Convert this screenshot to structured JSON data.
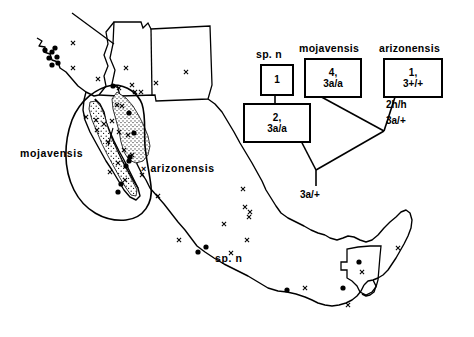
{
  "figure": {
    "type": "distribution-map-with-phylogeny",
    "background_color": "#ffffff",
    "line_color": "#000000"
  },
  "map": {
    "region_labels": [
      {
        "id": "mojavensis",
        "text": "mojavensis",
        "x": 20,
        "y": 148
      },
      {
        "id": "arizonensis",
        "text": "arizonensis",
        "x": 149,
        "y": 163,
        "marker": "x"
      },
      {
        "id": "sp-n",
        "text": "sp. n",
        "x": 215,
        "y": 253
      }
    ],
    "marker_legend": {
      "x_marker": "x",
      "dot_marker": "filled-circle",
      "stipple": "shaded-distribution-area"
    },
    "x_markers": [
      {
        "x": 73,
        "y": 43
      },
      {
        "x": 73,
        "y": 68
      },
      {
        "x": 126,
        "y": 68
      },
      {
        "x": 98,
        "y": 79
      },
      {
        "x": 156,
        "y": 83
      },
      {
        "x": 132,
        "y": 85
      },
      {
        "x": 186,
        "y": 72
      },
      {
        "x": 135,
        "y": 92
      },
      {
        "x": 141,
        "y": 92
      },
      {
        "x": 119,
        "y": 88
      },
      {
        "x": 117,
        "y": 105
      },
      {
        "x": 122,
        "y": 106
      },
      {
        "x": 86,
        "y": 117
      },
      {
        "x": 96,
        "y": 120
      },
      {
        "x": 104,
        "y": 124
      },
      {
        "x": 97,
        "y": 130
      },
      {
        "x": 112,
        "y": 121
      },
      {
        "x": 119,
        "y": 132
      },
      {
        "x": 128,
        "y": 135
      },
      {
        "x": 108,
        "y": 142
      },
      {
        "x": 124,
        "y": 150
      },
      {
        "x": 132,
        "y": 155
      },
      {
        "x": 118,
        "y": 163
      },
      {
        "x": 110,
        "y": 172
      },
      {
        "x": 125,
        "y": 180
      },
      {
        "x": 142,
        "y": 175
      },
      {
        "x": 158,
        "y": 196
      },
      {
        "x": 243,
        "y": 189
      },
      {
        "x": 245,
        "y": 207
      },
      {
        "x": 250,
        "y": 212
      },
      {
        "x": 249,
        "y": 217
      },
      {
        "x": 224,
        "y": 224
      },
      {
        "x": 247,
        "y": 240
      },
      {
        "x": 179,
        "y": 240
      },
      {
        "x": 231,
        "y": 253
      },
      {
        "x": 305,
        "y": 288
      },
      {
        "x": 348,
        "y": 305
      },
      {
        "x": 362,
        "y": 272
      },
      {
        "x": 398,
        "y": 248
      }
    ],
    "dot_markers": [
      {
        "x": 45,
        "y": 50
      },
      {
        "x": 52,
        "y": 52
      },
      {
        "x": 49,
        "y": 58
      },
      {
        "x": 57,
        "y": 57
      },
      {
        "x": 58,
        "y": 63
      },
      {
        "x": 52,
        "y": 65
      },
      {
        "x": 55,
        "y": 48
      },
      {
        "x": 113,
        "y": 86
      },
      {
        "x": 129,
        "y": 113
      },
      {
        "x": 134,
        "y": 133
      },
      {
        "x": 130,
        "y": 157
      },
      {
        "x": 129,
        "y": 161
      },
      {
        "x": 126,
        "y": 166
      },
      {
        "x": 121,
        "y": 184
      },
      {
        "x": 118,
        "y": 192
      },
      {
        "x": 206,
        "y": 247
      },
      {
        "x": 198,
        "y": 252
      },
      {
        "x": 287,
        "y": 290
      },
      {
        "x": 343,
        "y": 288
      },
      {
        "x": 359,
        "y": 262
      }
    ]
  },
  "diagram": {
    "nodes": [
      {
        "id": "sp-n",
        "taxon": "sp. n",
        "line1": "1",
        "line2": "",
        "x": 260,
        "y": 64,
        "w": 30,
        "h": 28
      },
      {
        "id": "sp-n-karyo",
        "taxon": "",
        "line1": "2,",
        "line2": "3a/a",
        "x": 243,
        "y": 103,
        "w": 64,
        "h": 36
      },
      {
        "id": "mojavensis",
        "taxon": "mojavensis",
        "line1": "4,",
        "line2": "3a/a",
        "x": 304,
        "y": 58,
        "w": 54,
        "h": 36
      },
      {
        "id": "arizonensis",
        "taxon": "arizonensis",
        "line1": "1,",
        "line2": "3+/+",
        "x": 383,
        "y": 58,
        "w": 56,
        "h": 36
      }
    ],
    "internal_labels": [
      {
        "id": "ancestor-2h",
        "text": "2h/h",
        "x": 386,
        "y": 102
      },
      {
        "id": "ancestor-3a1",
        "text": "3a/+",
        "x": 386,
        "y": 117
      },
      {
        "id": "root-3a",
        "text": "3a/+",
        "x": 316,
        "y": 188
      }
    ],
    "taxon_labels": [
      {
        "id": "sp-n-label",
        "text": "sp. n",
        "x": 256,
        "y": 48
      },
      {
        "id": "mojavensis-label",
        "text": "mojavensis",
        "x": 299,
        "y": 42
      },
      {
        "id": "arizonensis-label",
        "text": "arizonensis",
        "x": 379,
        "y": 42
      }
    ]
  }
}
